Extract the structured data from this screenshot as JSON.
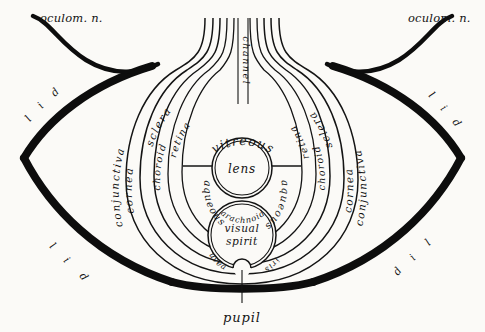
{
  "figure": {
    "background_color": "#fbfaf7",
    "ink_color": "#141414"
  },
  "nerves": {
    "left_label": "oculom. n.",
    "right_label": "oculom. n."
  },
  "lids": {
    "upper_left": {
      "letters": [
        "l",
        "i",
        "d"
      ]
    },
    "lower_left": {
      "letters": [
        "l",
        "i",
        "d"
      ]
    },
    "upper_right": {
      "letters": [
        "l",
        "i",
        "d"
      ]
    },
    "lower_right": {
      "letters": [
        "l",
        "i",
        "d"
      ]
    }
  },
  "layers": {
    "left": [
      {
        "key": "conjunctiva",
        "label": "conjunctiva"
      },
      {
        "key": "cornea",
        "label": "cornea"
      },
      {
        "key": "sclera",
        "label": "sclera"
      },
      {
        "key": "choroid",
        "label": "choroid"
      },
      {
        "key": "retina",
        "label": "retina"
      }
    ],
    "right": [
      {
        "key": "conjunctiva",
        "label": "conjunctiva"
      },
      {
        "key": "cornea",
        "label": "cornea"
      },
      {
        "key": "sclera",
        "label": "sclera"
      },
      {
        "key": "choroid",
        "label": "choroid"
      },
      {
        "key": "retina",
        "label": "retina"
      }
    ]
  },
  "chambers": {
    "vitreous": "vitreous",
    "aqueous_left": "aqueous",
    "aqueous_right": "aqueous",
    "arachnoid": "arachnoid"
  },
  "structures": {
    "lens": "lens",
    "visual_spirit_line1": "visual",
    "visual_spirit_line2": "spirit",
    "uvea": "uvea",
    "iris": "iris",
    "pupil": "pupil",
    "channel": "channel"
  }
}
